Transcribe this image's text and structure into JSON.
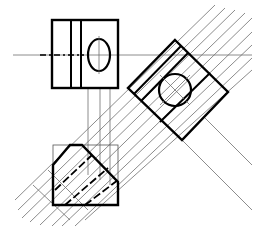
{
  "diagram": {
    "type": "orthographic-projection",
    "colors": {
      "background": "#ffffff",
      "outline": "#000000",
      "projection": "#6e6e6e",
      "thin": "#555555"
    },
    "views": [
      {
        "name": "top-view",
        "label": ""
      },
      {
        "name": "auxiliary-view",
        "label": ""
      },
      {
        "name": "front-view",
        "label": ""
      }
    ]
  }
}
